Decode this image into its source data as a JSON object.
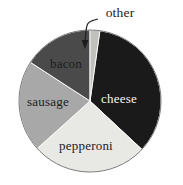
{
  "chart_data": {
    "type": "pie",
    "title": "",
    "subtitle": "",
    "xlabel": "",
    "ylabel": "",
    "legend_position": "none",
    "grid": false,
    "labels_on_slices": true,
    "start_angle_deg": 0,
    "direction": "clockwise",
    "categories": [
      "cheese",
      "pepperoni",
      "sausage",
      "bacon",
      "other"
    ],
    "values": [
      34.7,
      26.4,
      20.8,
      15.8,
      2.3
    ],
    "units": "percent",
    "slices": [
      {
        "label": "cheese",
        "value": 34.7,
        "angle_deg": 125,
        "start_deg": 8,
        "end_deg": 133,
        "color": "#1a1a1a",
        "label_color": "#f4f4f2",
        "label_x": 119,
        "label_y": 103,
        "label_placement": "inside"
      },
      {
        "label": "pepperoni",
        "value": 26.4,
        "angle_deg": 95,
        "start_deg": 133,
        "end_deg": 228,
        "color": "#e8e8e4",
        "label_color": "#1c1c1c",
        "label_x": 86,
        "label_y": 150,
        "label_placement": "inside"
      },
      {
        "label": "sausage",
        "value": 20.8,
        "angle_deg": 75,
        "start_deg": 228,
        "end_deg": 303,
        "color": "#a8a8a8",
        "label_color": "#1c1c1c",
        "label_x": 48,
        "label_y": 106,
        "label_placement": "inside"
      },
      {
        "label": "bacon",
        "value": 15.8,
        "angle_deg": 57,
        "start_deg": 303,
        "end_deg": 360,
        "color": "#4a4a4a",
        "label_color": "#1c1c1c",
        "label_x": 66,
        "label_y": 68,
        "label_placement": "inside"
      },
      {
        "label": "other",
        "value": 2.3,
        "angle_deg": 8,
        "start_deg": 0,
        "end_deg": 8,
        "color": "#c0c0bc",
        "label_color": "#1c1c1c",
        "label_x": 120,
        "label_y": 17,
        "label_placement": "callout"
      }
    ],
    "geometry": {
      "center_x": 90,
      "center_y": 101,
      "radius": 71
    },
    "callout": {
      "label": "other",
      "text_x": 120,
      "text_y": 17,
      "arrow_tip_x": 85,
      "arrow_tip_y": 49
    }
  },
  "colors": {
    "background": "#ffffff",
    "outline": "#6b6b6b",
    "cheese": "#1a1a1a",
    "pepperoni": "#e8e8e4",
    "sausage": "#a8a8a8",
    "bacon": "#4a4a4a",
    "other": "#c0c0bc",
    "text_dark": "#1c1c1c",
    "text_light": "#f4f4f2"
  }
}
